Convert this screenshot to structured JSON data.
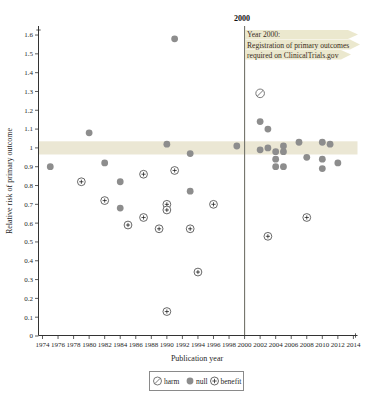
{
  "chart_data": {
    "type": "scatter",
    "title": "",
    "xlabel": "Publication year",
    "ylabel": "Relative risk of primary outcome",
    "xlim": [
      1974,
      2014
    ],
    "ylim": [
      0,
      1.6
    ],
    "x_ticks": [
      1974,
      1976,
      1978,
      1980,
      1982,
      1984,
      1986,
      1988,
      1990,
      1992,
      1994,
      1996,
      1998,
      2000,
      2002,
      2004,
      2006,
      2008,
      2010,
      2012,
      2014
    ],
    "y_ticks": [
      0,
      0.1,
      0.2,
      0.3,
      0.4,
      0.5,
      0.6,
      0.7,
      0.8,
      0.9,
      1,
      1.1,
      1.2,
      1.3,
      1.4,
      1.5,
      1.6
    ],
    "grid": false,
    "reference_band": {
      "y_from": 0.965,
      "y_to": 1.035,
      "color": "#ebe7d4"
    },
    "event_line": {
      "x": 2000,
      "label": "2000",
      "color": "#73736a"
    },
    "annotation": {
      "lines": [
        "Year 2000:",
        "Registration of primary outcomes",
        "required on ClinicalTrials.gov"
      ],
      "highlight_color": "#e8e4c6"
    },
    "legend": {
      "position": "bottom-center",
      "harm_label": "harm",
      "null_label": "null",
      "benefit_label": "benefit"
    },
    "series": [
      {
        "name": "harm",
        "marker": "slashed-open-circle",
        "color": "#6a6a6a",
        "points": [
          {
            "year": 2002,
            "rr": 1.29
          }
        ]
      },
      {
        "name": "null",
        "marker": "filled-circle",
        "color": "#8d8d8d",
        "points": [
          {
            "year": 1975,
            "rr": 0.9
          },
          {
            "year": 1980,
            "rr": 1.08
          },
          {
            "year": 1982,
            "rr": 0.92
          },
          {
            "year": 1984,
            "rr": 0.82
          },
          {
            "year": 1984,
            "rr": 0.68
          },
          {
            "year": 1990,
            "rr": 1.02
          },
          {
            "year": 1991,
            "rr": 1.58
          },
          {
            "year": 1993,
            "rr": 0.97
          },
          {
            "year": 1993,
            "rr": 0.77
          },
          {
            "year": 1999,
            "rr": 1.01
          },
          {
            "year": 2002,
            "rr": 1.14
          },
          {
            "year": 2002,
            "rr": 0.99
          },
          {
            "year": 2003,
            "rr": 1.1
          },
          {
            "year": 2003,
            "rr": 1.0
          },
          {
            "year": 2004,
            "rr": 0.98
          },
          {
            "year": 2004,
            "rr": 0.94
          },
          {
            "year": 2004,
            "rr": 0.9
          },
          {
            "year": 2005,
            "rr": 1.01
          },
          {
            "year": 2005,
            "rr": 0.98
          },
          {
            "year": 2005,
            "rr": 0.9
          },
          {
            "year": 2007,
            "rr": 1.03
          },
          {
            "year": 2008,
            "rr": 0.95
          },
          {
            "year": 2010,
            "rr": 1.03
          },
          {
            "year": 2010,
            "rr": 0.94
          },
          {
            "year": 2010,
            "rr": 0.89
          },
          {
            "year": 2011,
            "rr": 1.02
          },
          {
            "year": 2012,
            "rr": 0.92
          }
        ]
      },
      {
        "name": "benefit",
        "marker": "plus-circle",
        "color": "#565656",
        "points": [
          {
            "year": 1979,
            "rr": 0.82
          },
          {
            "year": 1982,
            "rr": 0.72
          },
          {
            "year": 1985,
            "rr": 0.59
          },
          {
            "year": 1987,
            "rr": 0.86
          },
          {
            "year": 1987,
            "rr": 0.63
          },
          {
            "year": 1989,
            "rr": 0.57
          },
          {
            "year": 1990,
            "rr": 0.7
          },
          {
            "year": 1990,
            "rr": 0.67
          },
          {
            "year": 1990,
            "rr": 0.13
          },
          {
            "year": 1991,
            "rr": 0.88
          },
          {
            "year": 1993,
            "rr": 0.57
          },
          {
            "year": 1994,
            "rr": 0.34
          },
          {
            "year": 1996,
            "rr": 0.7
          },
          {
            "year": 2003,
            "rr": 0.53
          },
          {
            "year": 2008,
            "rr": 0.63
          }
        ]
      }
    ]
  }
}
